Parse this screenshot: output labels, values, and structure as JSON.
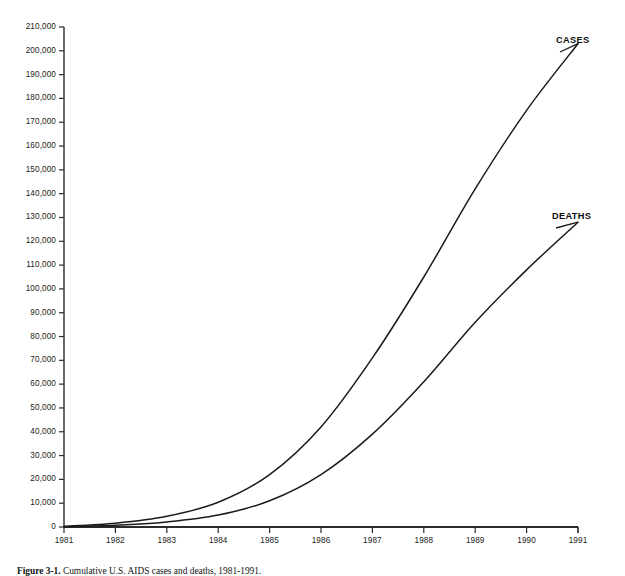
{
  "chart_data": {
    "type": "line",
    "title": "",
    "subtitle": "",
    "xlabel": "",
    "ylabel": "",
    "x": [
      1981,
      1982,
      1983,
      1984,
      1985,
      1986,
      1987,
      1988,
      1989,
      1990,
      1991
    ],
    "xlim": [
      1981,
      1991
    ],
    "ylim": [
      0,
      210000
    ],
    "ytick_interval": 10000,
    "grid": false,
    "legend_position": "inline-right-annotations",
    "line_color": "#1a1a1a",
    "axis_color": "#2b2b2b",
    "background": "#ffffff",
    "series": [
      {
        "name": "CASES",
        "values": [
          300,
          1600,
          4500,
          10400,
          22000,
          42000,
          71000,
          105000,
          142000,
          175000,
          203000
        ]
      },
      {
        "name": "DEATHS",
        "values": [
          150,
          700,
          2100,
          5000,
          11000,
          22000,
          39000,
          61000,
          86000,
          108000,
          128000
        ]
      }
    ],
    "ytick_labels": [
      "210,000",
      "200,000",
      "190,000",
      "180,000",
      "170,000",
      "160,000",
      "150,000",
      "140,000",
      "130,000",
      "120,000",
      "110,000",
      "100,000",
      "90,000",
      "80,000",
      "70,000",
      "60,000",
      "50,000",
      "40,000",
      "30,000",
      "20,000",
      "10,000",
      "0"
    ],
    "xtick_labels": [
      "1981",
      "1982",
      "1983",
      "1984",
      "1985",
      "1986",
      "1987",
      "1988",
      "1989",
      "1990",
      "1991"
    ],
    "annotations": [
      {
        "text": "CASES",
        "series": "CASES",
        "anchor_x": 1991,
        "anchor_y": 203000
      },
      {
        "text": "DEATHS",
        "series": "DEATHS",
        "anchor_x": 1991,
        "anchor_y": 128000
      }
    ]
  },
  "caption": {
    "figure_number": "Figure 3-1.",
    "text": "Cumulative U.S. AIDS cases and deaths, 1981-1991."
  }
}
